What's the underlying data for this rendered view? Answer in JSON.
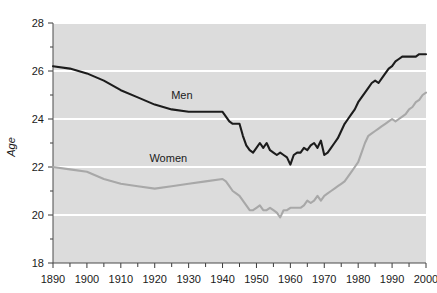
{
  "chart_data": {
    "type": "line",
    "title": "",
    "subtitle": "",
    "xlabel": "",
    "ylabel": "Age",
    "xlim": [
      1890,
      2000
    ],
    "ylim": [
      18,
      28
    ],
    "grid": "horizontal-white-gridlines-at-even-ages",
    "legend": "inline-series-labels",
    "background_color": "#dcdcdc",
    "gridline_color": "#ffffff",
    "x_tick_labels": [
      "1890",
      "1900",
      "1910",
      "1920",
      "1930",
      "1940",
      "1950",
      "1960",
      "1970",
      "1980",
      "1990",
      "2000"
    ],
    "x_tick_values": [
      1890,
      1900,
      1910,
      1920,
      1930,
      1940,
      1950,
      1960,
      1970,
      1980,
      1990,
      2000
    ],
    "x_minor_tick_values": [
      1895,
      1905,
      1915,
      1925,
      1935,
      1945,
      1955,
      1965,
      1975,
      1985,
      1995
    ],
    "y_tick_labels": [
      "18",
      "20",
      "22",
      "24",
      "26",
      "28"
    ],
    "y_tick_values": [
      18,
      20,
      22,
      24,
      26,
      28
    ],
    "y_minor_tick_values": [
      19,
      21,
      23,
      25,
      27
    ],
    "series": [
      {
        "name": "Men",
        "color": "#1c1c1c",
        "label_x": 1928,
        "label_y": 24.85,
        "x": [
          1890,
          1895,
          1900,
          1905,
          1910,
          1915,
          1920,
          1925,
          1930,
          1935,
          1940,
          1941,
          1942,
          1943,
          1944,
          1945,
          1946,
          1947,
          1948,
          1949,
          1950,
          1951,
          1952,
          1953,
          1954,
          1955,
          1956,
          1957,
          1958,
          1959,
          1960,
          1961,
          1962,
          1963,
          1964,
          1965,
          1966,
          1967,
          1968,
          1969,
          1970,
          1971,
          1972,
          1973,
          1974,
          1975,
          1976,
          1977,
          1978,
          1979,
          1980,
          1981,
          1982,
          1983,
          1984,
          1985,
          1986,
          1987,
          1988,
          1989,
          1990,
          1991,
          1992,
          1993,
          1994,
          1995,
          1996,
          1997,
          1998,
          1999,
          2000
        ],
        "y": [
          26.2,
          26.1,
          25.9,
          25.6,
          25.2,
          24.9,
          24.6,
          24.4,
          24.3,
          24.3,
          24.3,
          24.1,
          23.9,
          23.8,
          23.8,
          23.8,
          23.3,
          22.9,
          22.7,
          22.6,
          22.8,
          23.0,
          22.8,
          23.0,
          22.7,
          22.6,
          22.5,
          22.6,
          22.5,
          22.4,
          22.1,
          22.5,
          22.6,
          22.6,
          22.8,
          22.7,
          22.9,
          23.0,
          22.8,
          23.1,
          22.5,
          22.6,
          22.8,
          23.0,
          23.2,
          23.5,
          23.8,
          24.0,
          24.2,
          24.4,
          24.7,
          24.9,
          25.1,
          25.3,
          25.5,
          25.6,
          25.5,
          25.7,
          25.9,
          26.1,
          26.2,
          26.4,
          26.5,
          26.6,
          26.6,
          26.6,
          26.6,
          26.6,
          26.7,
          26.7,
          26.7
        ]
      },
      {
        "name": "Women",
        "color": "#a8a8a8",
        "label_x": 1924,
        "label_y": 22.2,
        "x": [
          1890,
          1895,
          1900,
          1905,
          1910,
          1915,
          1920,
          1925,
          1930,
          1935,
          1940,
          1941,
          1942,
          1943,
          1944,
          1945,
          1946,
          1947,
          1948,
          1949,
          1950,
          1951,
          1952,
          1953,
          1954,
          1955,
          1956,
          1957,
          1958,
          1959,
          1960,
          1961,
          1962,
          1963,
          1964,
          1965,
          1966,
          1967,
          1968,
          1969,
          1970,
          1971,
          1972,
          1973,
          1974,
          1975,
          1976,
          1977,
          1978,
          1979,
          1980,
          1981,
          1982,
          1983,
          1984,
          1985,
          1986,
          1987,
          1988,
          1989,
          1990,
          1991,
          1992,
          1993,
          1994,
          1995,
          1996,
          1997,
          1998,
          1999,
          2000
        ],
        "y": [
          22.0,
          21.9,
          21.8,
          21.5,
          21.3,
          21.2,
          21.1,
          21.2,
          21.3,
          21.4,
          21.5,
          21.4,
          21.2,
          21.0,
          20.9,
          20.8,
          20.6,
          20.4,
          20.2,
          20.2,
          20.3,
          20.4,
          20.2,
          20.2,
          20.3,
          20.2,
          20.1,
          19.9,
          20.2,
          20.2,
          20.3,
          20.3,
          20.3,
          20.3,
          20.4,
          20.6,
          20.5,
          20.6,
          20.8,
          20.6,
          20.8,
          20.9,
          21.0,
          21.1,
          21.2,
          21.3,
          21.4,
          21.6,
          21.8,
          22.0,
          22.2,
          22.6,
          23.0,
          23.3,
          23.4,
          23.5,
          23.6,
          23.7,
          23.8,
          23.9,
          24.0,
          23.9,
          24.0,
          24.1,
          24.2,
          24.4,
          24.5,
          24.7,
          24.8,
          25.0,
          25.1
        ]
      }
    ]
  },
  "axes": {
    "y_axis_title": "Age"
  }
}
